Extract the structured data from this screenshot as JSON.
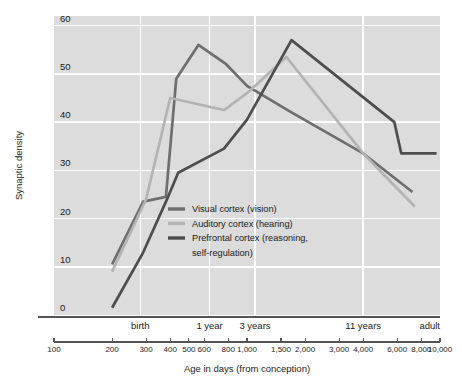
{
  "chart_data": {
    "type": "line",
    "title": "",
    "xlabel": "Age in days (from conception)",
    "ylabel": "Synaptic density",
    "xscale": "log",
    "xlim": [
      100,
      10000
    ],
    "ylim": [
      0,
      62
    ],
    "grid": true,
    "legend_position": "center-left-inside",
    "y_ticks": [
      0,
      10,
      20,
      30,
      40,
      50,
      60
    ],
    "x_ticks": [
      100,
      200,
      300,
      400,
      500,
      600,
      800,
      1000,
      1500,
      2000,
      3000,
      4000,
      6000,
      8000,
      10000
    ],
    "x_tick_labels": [
      "100",
      "200",
      "300",
      "400",
      "500",
      "600",
      "800",
      "1,000",
      "1,500",
      "2,000",
      "3,000",
      "4,000",
      "6,000",
      "8,000",
      "10,000"
    ],
    "era_markers": [
      {
        "label": "birth",
        "x": 280
      },
      {
        "label": "1 year",
        "x": 640
      },
      {
        "label": "3 years",
        "x": 1100
      },
      {
        "label": "11 years",
        "x": 4000
      },
      {
        "label": "adult",
        "x": 10000
      }
    ],
    "era_gridlines": [
      280,
      640,
      1100,
      4000
    ],
    "series": [
      {
        "name": "Visual cortex (vision)",
        "color": "#6e6e6e",
        "points": [
          {
            "x": 200,
            "y": 10.5
          },
          {
            "x": 290,
            "y": 23.5
          },
          {
            "x": 380,
            "y": 24.5
          },
          {
            "x": 430,
            "y": 49.0
          },
          {
            "x": 560,
            "y": 56.0
          },
          {
            "x": 780,
            "y": 52.0
          },
          {
            "x": 1000,
            "y": 47.5
          },
          {
            "x": 1700,
            "y": 42.0
          },
          {
            "x": 4000,
            "y": 33.5
          },
          {
            "x": 7200,
            "y": 25.5
          }
        ]
      },
      {
        "name": "Auditory cortex (hearing)",
        "color": "#b3b3b3",
        "points": [
          {
            "x": 200,
            "y": 9.0
          },
          {
            "x": 300,
            "y": 24.0
          },
          {
            "x": 400,
            "y": 45.0
          },
          {
            "x": 760,
            "y": 42.5
          },
          {
            "x": 1000,
            "y": 46.0
          },
          {
            "x": 1600,
            "y": 53.5
          },
          {
            "x": 4000,
            "y": 33.5
          },
          {
            "x": 7400,
            "y": 22.5
          }
        ]
      },
      {
        "name": "Prefrontal cortex (reasoning, self-regulation)",
        "color": "#4d4d4d",
        "points": [
          {
            "x": 200,
            "y": 1.5
          },
          {
            "x": 290,
            "y": 13.0
          },
          {
            "x": 390,
            "y": 24.5
          },
          {
            "x": 440,
            "y": 29.5
          },
          {
            "x": 760,
            "y": 34.5
          },
          {
            "x": 1000,
            "y": 40.5
          },
          {
            "x": 1700,
            "y": 57.0
          },
          {
            "x": 5800,
            "y": 40.0
          },
          {
            "x": 6300,
            "y": 33.5
          },
          {
            "x": 9600,
            "y": 33.5
          }
        ]
      }
    ],
    "legend": [
      {
        "label": "Visual cortex (vision)",
        "color": "#6e6e6e"
      },
      {
        "label": "Auditory cortex (hearing)",
        "color": "#b3b3b3"
      },
      {
        "label": "Prefrontal cortex (reasoning,",
        "color": "#4d4d4d"
      },
      {
        "label": "self-regulation)",
        "color": ""
      }
    ]
  }
}
